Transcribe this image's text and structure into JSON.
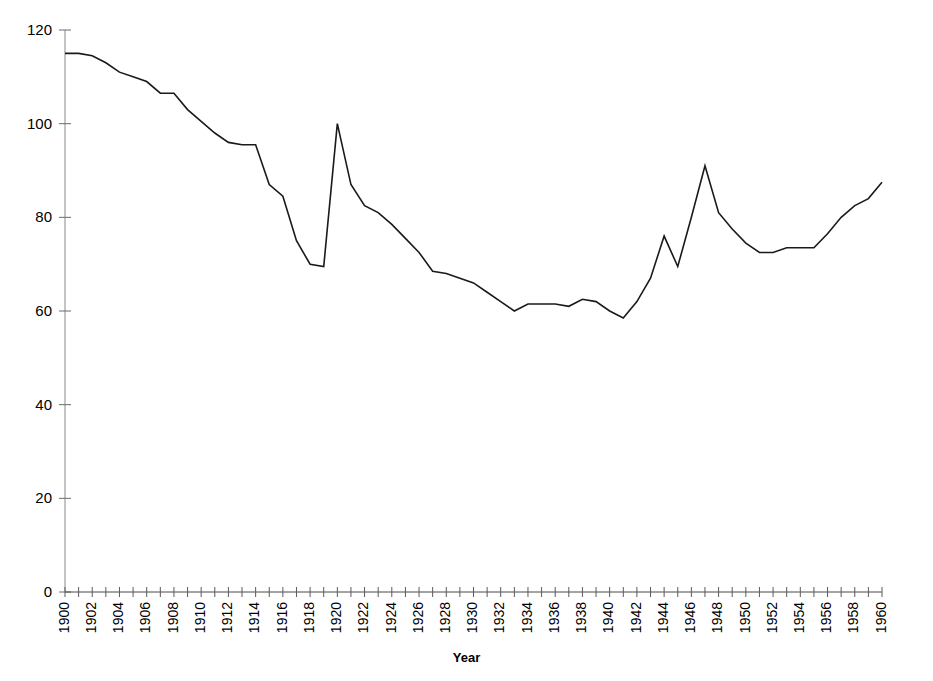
{
  "chart_data": {
    "type": "line",
    "title": "",
    "xlabel": "Year",
    "ylabel": "",
    "xlim": [
      1900,
      1960
    ],
    "ylim": [
      0,
      120
    ],
    "grid": false,
    "legend": null,
    "y_ticks": [
      0,
      20,
      40,
      60,
      80,
      100,
      120
    ],
    "x_ticks_labeled": [
      1900,
      1902,
      1904,
      1906,
      1908,
      1910,
      1912,
      1914,
      1916,
      1918,
      1920,
      1922,
      1924,
      1926,
      1928,
      1930,
      1932,
      1934,
      1936,
      1938,
      1940,
      1942,
      1944,
      1946,
      1948,
      1950,
      1952,
      1954,
      1956,
      1958,
      1960
    ],
    "x_tick_interval_minor": 1,
    "line_color": "#1a1a1a",
    "line_width": 1.6,
    "x": [
      1900,
      1901,
      1902,
      1903,
      1904,
      1905,
      1906,
      1907,
      1908,
      1909,
      1910,
      1911,
      1912,
      1913,
      1914,
      1915,
      1916,
      1917,
      1918,
      1919,
      1920,
      1921,
      1922,
      1923,
      1924,
      1925,
      1926,
      1927,
      1928,
      1929,
      1930,
      1931,
      1932,
      1933,
      1934,
      1935,
      1936,
      1937,
      1938,
      1939,
      1940,
      1941,
      1942,
      1943,
      1944,
      1945,
      1946,
      1947,
      1948,
      1949,
      1950,
      1951,
      1952,
      1953,
      1954,
      1955,
      1956,
      1957,
      1958,
      1959,
      1960
    ],
    "values": [
      115,
      115,
      114.5,
      113,
      111,
      110,
      109,
      106.5,
      106.5,
      103,
      100.5,
      98,
      96,
      95.5,
      95.5,
      87,
      84.5,
      75,
      70,
      69.5,
      100,
      87,
      82.5,
      81,
      78.5,
      75.5,
      72.5,
      68.5,
      68,
      67,
      66,
      64,
      62,
      60,
      61.5,
      61.5,
      61.5,
      61,
      62.5,
      62,
      60,
      58.5,
      62,
      67,
      76,
      69.5,
      80,
      91,
      81,
      77.5,
      74.5,
      72.5,
      72.5,
      73.5,
      73.5,
      73.5,
      76.5,
      80,
      82.5,
      84,
      87.5
    ]
  },
  "axis": {
    "xaxis_label": "Year"
  }
}
